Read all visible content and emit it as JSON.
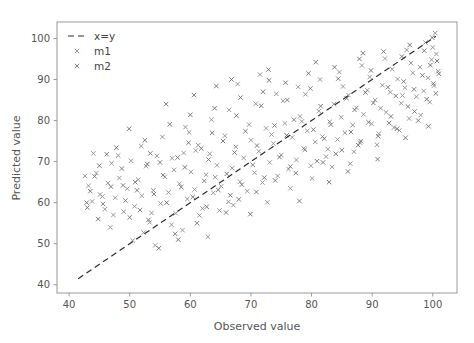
{
  "chart_data": {
    "type": "scatter",
    "title": "",
    "xlabel": "Observed value",
    "ylabel": "Predicted value",
    "xlim": [
      38,
      104
    ],
    "ylim": [
      38,
      104
    ],
    "xticks": [
      40,
      50,
      60,
      70,
      80,
      90,
      100
    ],
    "yticks": [
      40,
      50,
      60,
      70,
      80,
      90,
      100
    ],
    "xticklabels": [
      "40",
      "50",
      "60",
      "70",
      "80",
      "90",
      "100"
    ],
    "yticklabels": [
      "40",
      "50",
      "60",
      "70",
      "80",
      "90",
      "100"
    ],
    "grid": false,
    "legend_position": "upper left",
    "legend": [
      {
        "label": "x=y",
        "type": "line",
        "style": "dashed",
        "color": "#2b2b2b"
      },
      {
        "label": "m1",
        "type": "marker",
        "marker": "x",
        "color": "#8c8c8c"
      },
      {
        "label": "m2",
        "type": "marker",
        "marker": "x",
        "color": "#6e6e6e"
      }
    ],
    "reference_line": {
      "label": "x=y",
      "x": [
        41.5,
        100.5
      ],
      "y": [
        41.5,
        100.5
      ]
    },
    "series": [
      {
        "name": "m1",
        "marker": "x",
        "color": "#8c8c8c",
        "points": [
          [
            43.2,
            64.1
          ],
          [
            43.8,
            60.3
          ],
          [
            44.5,
            67.2
          ],
          [
            45.1,
            62.0
          ],
          [
            45.9,
            58.4
          ],
          [
            46.4,
            64.8
          ],
          [
            47.0,
            69.6
          ],
          [
            47.6,
            61.2
          ],
          [
            48.3,
            66.0
          ],
          [
            49.0,
            57.8
          ],
          [
            49.6,
            63.4
          ],
          [
            50.2,
            70.2
          ],
          [
            50.8,
            59.1
          ],
          [
            51.4,
            65.6
          ],
          [
            52.0,
            61.7
          ],
          [
            52.7,
            68.9
          ],
          [
            53.3,
            55.2
          ],
          [
            53.9,
            63.0
          ],
          [
            54.5,
            71.4
          ],
          [
            55.1,
            59.8
          ],
          [
            55.8,
            66.3
          ],
          [
            56.4,
            62.5
          ],
          [
            57.0,
            70.8
          ],
          [
            57.6,
            57.4
          ],
          [
            58.2,
            64.6
          ],
          [
            58.9,
            72.1
          ],
          [
            59.5,
            60.9
          ],
          [
            60.1,
            67.5
          ],
          [
            60.7,
            63.2
          ],
          [
            61.3,
            74.0
          ],
          [
            62.0,
            58.6
          ],
          [
            62.6,
            66.8
          ],
          [
            63.2,
            71.9
          ],
          [
            63.8,
            62.4
          ],
          [
            64.4,
            69.1
          ],
          [
            65.1,
            64.0
          ],
          [
            65.7,
            76.3
          ],
          [
            66.3,
            60.2
          ],
          [
            66.9,
            68.4
          ],
          [
            67.5,
            73.6
          ],
          [
            68.2,
            65.1
          ],
          [
            68.8,
            70.9
          ],
          [
            69.4,
            62.8
          ],
          [
            70.0,
            75.2
          ],
          [
            70.6,
            67.3
          ],
          [
            71.3,
            72.5
          ],
          [
            71.9,
            64.9
          ],
          [
            72.5,
            78.1
          ],
          [
            73.1,
            69.8
          ],
          [
            73.7,
            74.4
          ],
          [
            74.4,
            66.5
          ],
          [
            75.0,
            71.6
          ],
          [
            75.6,
            79.3
          ],
          [
            76.2,
            68.2
          ],
          [
            76.8,
            75.9
          ],
          [
            77.5,
            70.4
          ],
          [
            78.1,
            81.0
          ],
          [
            78.7,
            73.2
          ],
          [
            79.3,
            77.5
          ],
          [
            79.9,
            69.0
          ],
          [
            80.6,
            74.8
          ],
          [
            81.2,
            82.3
          ],
          [
            81.8,
            76.1
          ],
          [
            82.4,
            71.2
          ],
          [
            83.0,
            79.7
          ],
          [
            83.7,
            84.0
          ],
          [
            84.3,
            75.4
          ],
          [
            84.9,
            80.8
          ],
          [
            85.5,
            77.0
          ],
          [
            86.1,
            86.2
          ],
          [
            86.8,
            78.9
          ],
          [
            87.4,
            83.1
          ],
          [
            88.0,
            74.6
          ],
          [
            88.6,
            81.5
          ],
          [
            89.2,
            87.4
          ],
          [
            89.9,
            79.2
          ],
          [
            90.5,
            85.0
          ],
          [
            91.1,
            76.8
          ],
          [
            91.7,
            88.6
          ],
          [
            92.3,
            82.0
          ],
          [
            93.0,
            86.9
          ],
          [
            93.6,
            78.3
          ],
          [
            94.2,
            90.1
          ],
          [
            94.8,
            84.2
          ],
          [
            95.4,
            88.0
          ],
          [
            96.1,
            80.5
          ],
          [
            96.7,
            91.6
          ],
          [
            97.3,
            85.8
          ],
          [
            97.9,
            93.0
          ],
          [
            98.5,
            87.2
          ],
          [
            99.2,
            90.4
          ],
          [
            99.8,
            94.8
          ],
          [
            100.2,
            88.5
          ],
          [
            100.6,
            96.2
          ],
          [
            100.9,
            92.0
          ],
          [
            52.3,
            52.7
          ],
          [
            56.9,
            54.6
          ],
          [
            61.5,
            56.9
          ],
          [
            64.8,
            58.1
          ],
          [
            67.1,
            59.4
          ],
          [
            59.2,
            78.4
          ],
          [
            63.5,
            80.2
          ],
          [
            66.4,
            82.6
          ],
          [
            70.8,
            84.1
          ],
          [
            74.2,
            86.5
          ],
          [
            77.8,
            88.2
          ],
          [
            81.4,
            90.0
          ],
          [
            84.6,
            91.8
          ],
          [
            88.3,
            93.4
          ],
          [
            92.1,
            95.1
          ],
          [
            95.7,
            97.2
          ],
          [
            98.8,
            99.0
          ],
          [
            100.4,
            101.3
          ],
          [
            46.8,
            54.0
          ],
          [
            50.5,
            50.8
          ],
          [
            54.2,
            49.6
          ],
          [
            58.7,
            53.3
          ],
          [
            62.9,
            51.7
          ],
          [
            48.1,
            71.5
          ],
          [
            51.9,
            73.8
          ],
          [
            55.4,
            76.0
          ],
          [
            59.8,
            77.1
          ],
          [
            72.7,
            60.1
          ],
          [
            76.5,
            63.5
          ],
          [
            80.1,
            65.9
          ],
          [
            83.4,
            68.7
          ],
          [
            87.0,
            72.4
          ],
          [
            90.8,
            74.1
          ],
          [
            94.5,
            77.6
          ],
          [
            98.0,
            81.3
          ],
          [
            67.8,
            88.9
          ],
          [
            71.5,
            91.2
          ],
          [
            75.3,
            84.8
          ],
          [
            79.0,
            86.4
          ],
          [
            82.7,
            73.0
          ],
          [
            86.4,
            69.5
          ],
          [
            91.4,
            83.0
          ],
          [
            95.0,
            86.1
          ],
          [
            99.5,
            84.5
          ],
          [
            44.0,
            72.0
          ],
          [
            47.3,
            57.0
          ],
          [
            53.6,
            57.5
          ],
          [
            57.3,
            68.0
          ],
          [
            60.9,
            72.7
          ],
          [
            64.1,
            66.2
          ],
          [
            69.7,
            79.0
          ],
          [
            73.4,
            76.6
          ],
          [
            78.4,
            79.8
          ],
          [
            85.2,
            88.3
          ],
          [
            89.6,
            90.6
          ],
          [
            93.3,
            92.5
          ],
          [
            96.4,
            94.0
          ],
          [
            100.0,
            97.8
          ],
          [
            42.6,
            66.5
          ],
          [
            45.5,
            61.5
          ]
        ]
      },
      {
        "name": "m2",
        "marker": "x",
        "color": "#6e6e6e",
        "points": [
          [
            43.5,
            62.8
          ],
          [
            44.2,
            66.4
          ],
          [
            45.6,
            59.7
          ],
          [
            46.9,
            63.9
          ],
          [
            48.7,
            68.3
          ],
          [
            49.3,
            60.5
          ],
          [
            50.9,
            65.0
          ],
          [
            51.7,
            58.2
          ],
          [
            52.9,
            69.4
          ],
          [
            54.0,
            62.1
          ],
          [
            55.5,
            66.7
          ],
          [
            56.1,
            60.0
          ],
          [
            57.9,
            71.0
          ],
          [
            58.5,
            63.8
          ],
          [
            59.1,
            68.6
          ],
          [
            60.4,
            61.4
          ],
          [
            61.8,
            73.2
          ],
          [
            62.3,
            65.3
          ],
          [
            63.0,
            70.5
          ],
          [
            64.6,
            63.1
          ],
          [
            65.4,
            75.0
          ],
          [
            66.0,
            67.0
          ],
          [
            67.3,
            72.2
          ],
          [
            68.5,
            64.4
          ],
          [
            69.1,
            77.4
          ],
          [
            70.3,
            69.2
          ],
          [
            71.0,
            73.9
          ],
          [
            72.2,
            66.1
          ],
          [
            73.9,
            78.8
          ],
          [
            74.7,
            71.1
          ],
          [
            75.9,
            76.4
          ],
          [
            76.5,
            68.8
          ],
          [
            77.1,
            80.2
          ],
          [
            78.9,
            72.9
          ],
          [
            80.3,
            77.8
          ],
          [
            80.9,
            70.1
          ],
          [
            81.5,
            83.5
          ],
          [
            82.1,
            75.6
          ],
          [
            83.2,
            79.0
          ],
          [
            84.0,
            71.9
          ],
          [
            85.8,
            85.4
          ],
          [
            86.5,
            77.2
          ],
          [
            87.1,
            82.6
          ],
          [
            87.7,
            74.0
          ],
          [
            88.9,
            86.8
          ],
          [
            89.4,
            79.6
          ],
          [
            90.2,
            84.3
          ],
          [
            91.0,
            76.2
          ],
          [
            92.6,
            88.1
          ],
          [
            93.1,
            81.0
          ],
          [
            93.9,
            86.0
          ],
          [
            94.1,
            78.0
          ],
          [
            95.2,
            89.5
          ],
          [
            95.9,
            83.4
          ],
          [
            96.9,
            87.6
          ],
          [
            97.6,
            80.0
          ],
          [
            98.3,
            91.0
          ],
          [
            99.0,
            85.2
          ],
          [
            99.6,
            93.5
          ],
          [
            100.1,
            89.0
          ],
          [
            100.7,
            94.5
          ],
          [
            101.0,
            91.4
          ],
          [
            53.1,
            55.8
          ],
          [
            57.5,
            52.4
          ],
          [
            61.1,
            55.0
          ],
          [
            65.9,
            57.6
          ],
          [
            68.0,
            60.8
          ],
          [
            47.8,
            73.4
          ],
          [
            52.5,
            75.2
          ],
          [
            56.6,
            79.1
          ],
          [
            60.0,
            81.4
          ],
          [
            64.0,
            83.0
          ],
          [
            68.3,
            85.6
          ],
          [
            72.0,
            87.0
          ],
          [
            75.7,
            89.2
          ],
          [
            79.5,
            91.5
          ],
          [
            83.8,
            93.0
          ],
          [
            87.9,
            95.0
          ],
          [
            91.9,
            96.8
          ],
          [
            96.2,
            98.4
          ],
          [
            99.9,
            100.2
          ],
          [
            45.0,
            69.0
          ],
          [
            48.9,
            64.2
          ],
          [
            50.0,
            56.4
          ],
          [
            54.8,
            48.9
          ],
          [
            58.0,
            51.0
          ],
          [
            62.7,
            59.0
          ],
          [
            66.6,
            61.8
          ],
          [
            70.9,
            62.6
          ],
          [
            74.0,
            65.4
          ],
          [
            77.4,
            67.2
          ],
          [
            81.9,
            69.8
          ],
          [
            85.0,
            72.8
          ],
          [
            88.1,
            75.0
          ],
          [
            92.8,
            79.4
          ],
          [
            97.0,
            82.2
          ],
          [
            100.5,
            86.6
          ],
          [
            43.0,
            58.8
          ],
          [
            46.2,
            71.8
          ],
          [
            49.9,
            78.0
          ],
          [
            53.4,
            72.0
          ],
          [
            59.7,
            74.6
          ],
          [
            63.6,
            77.0
          ],
          [
            67.6,
            81.2
          ],
          [
            71.7,
            83.6
          ],
          [
            76.0,
            85.0
          ],
          [
            79.8,
            87.8
          ],
          [
            84.4,
            90.2
          ],
          [
            89.8,
            92.2
          ],
          [
            94.9,
            95.6
          ],
          [
            98.6,
            97.0
          ],
          [
            51.2,
            63.0
          ],
          [
            55.0,
            69.8
          ],
          [
            64.3,
            88.4
          ],
          [
            69.9,
            57.2
          ],
          [
            73.0,
            89.8
          ],
          [
            78.0,
            60.4
          ],
          [
            82.9,
            65.0
          ],
          [
            86.0,
            67.6
          ],
          [
            90.9,
            70.6
          ],
          [
            95.5,
            75.8
          ],
          [
            99.3,
            78.6
          ],
          [
            42.9,
            60.0
          ],
          [
            44.8,
            56.0
          ],
          [
            56.0,
            84.0
          ],
          [
            60.6,
            86.2
          ],
          [
            66.8,
            90.0
          ],
          [
            72.9,
            92.4
          ],
          [
            80.7,
            94.2
          ],
          [
            88.5,
            96.4
          ]
        ]
      }
    ]
  }
}
